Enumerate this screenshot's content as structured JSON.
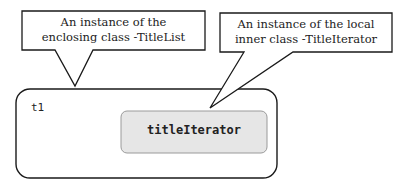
{
  "callouts": [
    {
      "line1": "An instance of the",
      "line2": "enclosing class -TitleList"
    },
    {
      "line1": "An instance of the local",
      "line2": "inner class -TitleIterator"
    }
  ],
  "outer_object": {
    "label": "t1"
  },
  "inner_object": {
    "label": "titleIterator",
    "fill": "#e6e6e6"
  },
  "colors": {
    "stroke": "#1a1a1a",
    "inner_fill": "#e6e6e6",
    "inner_stroke": "#9a9a9a"
  }
}
